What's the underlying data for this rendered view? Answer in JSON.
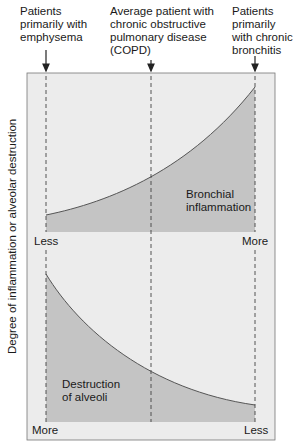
{
  "header_labels": {
    "left": [
      "Patients",
      "primarily with",
      "emphysema"
    ],
    "middle": [
      "Average patient with",
      "chronic obstructive",
      "pulmonary disease",
      "(COPD)"
    ],
    "right": [
      "Patients",
      "primarily",
      "with chronic",
      "bronchitis"
    ]
  },
  "y_axis_label": "Degree of inflammation or alveolar destruction",
  "upper_panel": {
    "area_label": [
      "Bronchial",
      "inflammation"
    ],
    "left_end": "Less",
    "right_end": "More"
  },
  "lower_panel": {
    "area_label": [
      "Destruction",
      "of alveoli"
    ],
    "left_end": "More",
    "right_end": "Less"
  },
  "colors": {
    "frame_bg": "#ececec",
    "area_fill": "#c4c4c4",
    "curve": "#555555",
    "dashed": "#444444"
  }
}
